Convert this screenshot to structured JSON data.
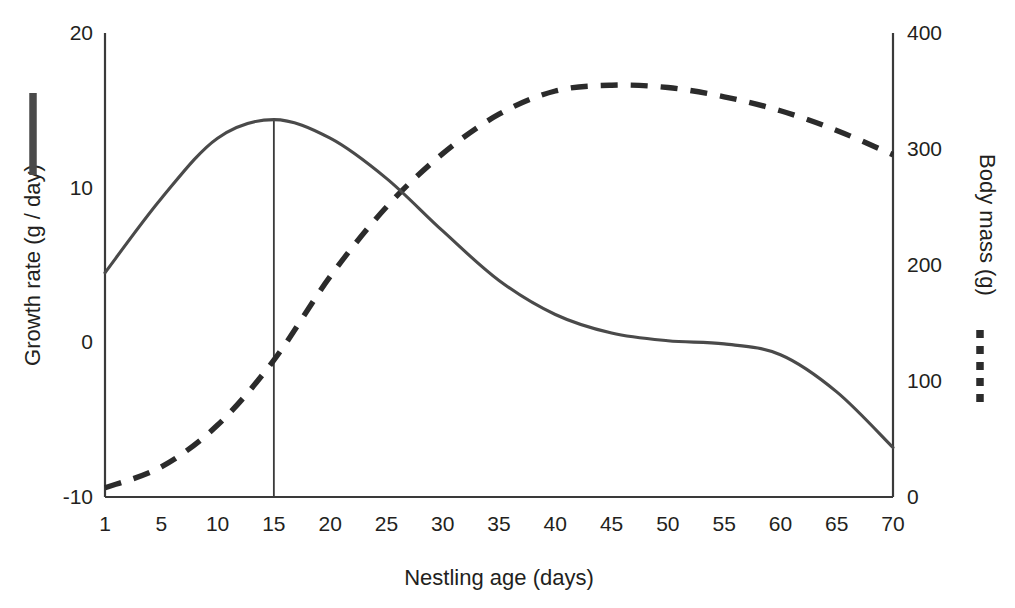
{
  "chart_data": {
    "type": "line",
    "title": "",
    "subtitle": "",
    "xlabel": "Nestling age (days)",
    "ylabel": "Growth rate (g / day)",
    "ylabel_right": "Body mass (g)",
    "categories": [
      1,
      5,
      10,
      15,
      20,
      25,
      30,
      35,
      40,
      45,
      50,
      55,
      60,
      65,
      70
    ],
    "x_tick_labels": [
      "1",
      "5",
      "10",
      "15",
      "20",
      "25",
      "30",
      "35",
      "40",
      "45",
      "50",
      "55",
      "60",
      "65",
      "70"
    ],
    "x_axis_type": "categorical-evenly-spaced",
    "left_axis": {
      "label": "Growth rate (g / day)",
      "ticks": [
        -10,
        0,
        10,
        20
      ],
      "tick_labels": [
        "-10",
        "0",
        "10",
        "20"
      ],
      "ylim": [
        -10,
        20
      ]
    },
    "right_axis": {
      "label": "Body mass (g)",
      "ticks": [
        0,
        100,
        200,
        300,
        400
      ],
      "tick_labels": [
        "0",
        "100",
        "200",
        "300",
        "400"
      ],
      "ylim": [
        0,
        400
      ]
    },
    "grid": false,
    "legend_position": "outside-left-and-right",
    "annotations": [
      {
        "name": "peak-growth-reference-line",
        "type": "vline",
        "x": 15,
        "label": ""
      }
    ],
    "series": [
      {
        "name": "Growth rate",
        "axis": "left",
        "style": "solid",
        "color": "#4a4a4a",
        "values": [
          4.5,
          9.3,
          13.2,
          14.4,
          13.2,
          10.6,
          7.2,
          4.0,
          1.8,
          0.6,
          0.1,
          -0.1,
          -0.8,
          -3.2,
          -6.8
        ]
      },
      {
        "name": "Body mass",
        "axis": "right",
        "style": "dashed",
        "color": "#2b2b2b",
        "values": [
          8,
          26,
          62,
          118,
          190,
          250,
          296,
          330,
          350,
          355,
          353,
          345,
          333,
          316,
          295
        ]
      }
    ]
  },
  "legend": {
    "growth_rate_marker": "solid-line-marker",
    "body_mass_marker": "dashed-line-marker"
  },
  "axis_titles": {
    "left": "Growth rate (g / day)",
    "right": "Body mass (g)",
    "bottom": "Nestling age (days)"
  },
  "colors": {
    "solid_series": "#4a4a4a",
    "dashed_series": "#2b2b2b",
    "axis": "#3a3a3a",
    "text": "#231f20",
    "background": "#ffffff"
  }
}
